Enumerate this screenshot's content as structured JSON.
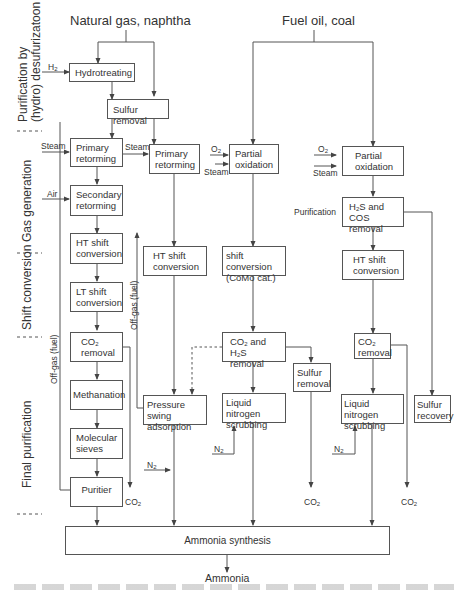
{
  "sources": {
    "natural_gas": "Natural gas, naphtha",
    "fuel_oil": "Fuel oil, coal"
  },
  "stages": [
    {
      "id": "purification",
      "label_line1": "Purification by",
      "label_line2": "(hydro) desufurizatoon"
    },
    {
      "id": "gas_generation",
      "label_line1": "Gas generation"
    },
    {
      "id": "shift_conversion",
      "label_line1": "Shift conversion"
    },
    {
      "id": "final_purification",
      "label_line1": "Final purification"
    }
  ],
  "boxes": {
    "hydrotreating": "Hydrotreating",
    "sulfur_removal_1": "Sulfur removal",
    "primary_reforming_1": [
      "Primary",
      "retorming"
    ],
    "secondary_reforming": [
      "Secondary",
      "retorming"
    ],
    "ht_shift_1": [
      "HT shift",
      "conversion"
    ],
    "lt_shift": [
      "LT shift",
      "conversion"
    ],
    "co2_removal_1": [
      "CO2",
      "removal"
    ],
    "methanation": "Methanation",
    "molecular_sieves": [
      "Molecular",
      "sieves"
    ],
    "purifier": "Puritier",
    "primary_reforming_2": [
      "Primary",
      "retorming"
    ],
    "ht_shift_2": [
      "HT shift",
      "conversion"
    ],
    "psa": [
      "Pressure swing",
      "adsorption"
    ],
    "partial_oxidation_1": [
      "Partial",
      "oxidation"
    ],
    "shift_como": [
      "shift conversion",
      "(CoMo cat.)"
    ],
    "co2_h2s_removal": [
      "CO2 and H2S",
      "removal"
    ],
    "ln_scrubbing_1": [
      "Liquid nitrogen",
      "scrubbing"
    ],
    "sulfur_removal_2": [
      "Sulfur",
      "removal"
    ],
    "partial_oxidation_2": [
      "Partial",
      "oxidation"
    ],
    "h2s_cos_removal": [
      "H2S and COS",
      "removal"
    ],
    "ht_shift_3": [
      "HT shift",
      "conversion"
    ],
    "co2_removal_2": [
      "CO2",
      "removal"
    ],
    "ln_scrubbing_2": [
      "Liquid nitrogen",
      "scrubbing"
    ],
    "sulfur_recovery": [
      "Sulfur",
      "recovery"
    ],
    "ammonia_synthesis": "Ammonia synthesis"
  },
  "labels": {
    "h2": "H2",
    "steam": "Steam",
    "air": "Air",
    "o2": "O2",
    "n2": "N2",
    "co2": "CO2",
    "off_gas_fuel": "Off-gas (fuel)",
    "purification": "Purification",
    "product": "Ammonia"
  }
}
